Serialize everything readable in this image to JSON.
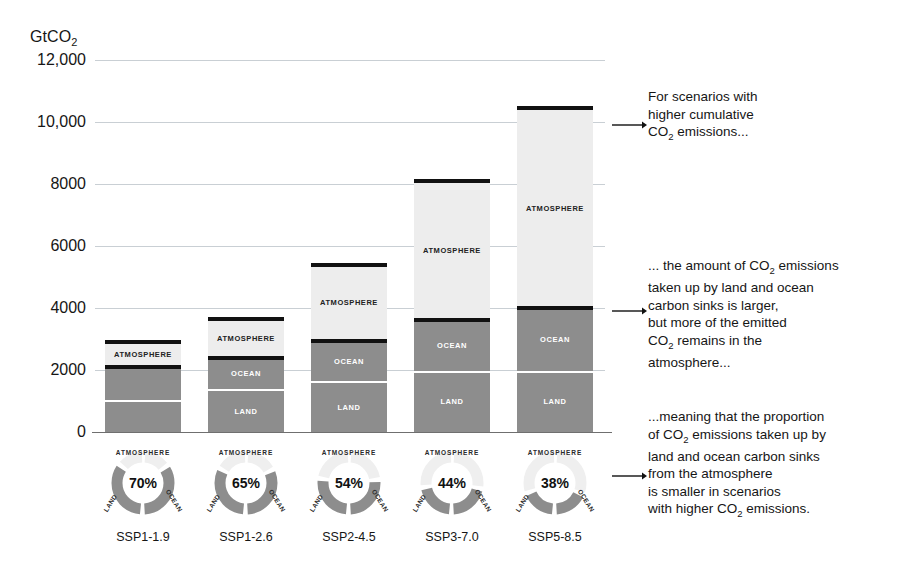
{
  "axis": {
    "unit_label": "GtCO",
    "unit_sub": "2",
    "ticks": [
      "12,000",
      "10,000",
      "8000",
      "6000",
      "4000",
      "2000",
      "0"
    ],
    "tick_values": [
      12000,
      10000,
      8000,
      6000,
      4000,
      2000,
      0
    ]
  },
  "segment_labels": {
    "atmosphere": "ATMOSPHERE",
    "ocean": "OCEAN",
    "land": "LAND"
  },
  "colors": {
    "atmosphere": "#ededed",
    "ocean": "#8d8d8d",
    "land": "#8d8d8d",
    "cap": "#111111",
    "gridline": "#c9cfd4",
    "baseline": "#6f6f6f",
    "donut_sink": "#8d8d8d",
    "donut_atmosphere": "#efefef"
  },
  "bars": [
    {
      "name": "SSP1-1.9",
      "total": 2900,
      "land": 1000,
      "ocean": 1100,
      "atmosphere": 800,
      "sink_percent": "70%",
      "sink_percent_value": 70,
      "show_ocean_label": false,
      "show_land_label": false
    },
    {
      "name": "SSP1-2.6",
      "total": 3650,
      "land": 1350,
      "ocean": 1050,
      "atmosphere": 1250,
      "sink_percent": "65%",
      "sink_percent_value": 65,
      "show_ocean_label": true,
      "show_land_label": true
    },
    {
      "name": "SSP2-4.5",
      "total": 5400,
      "land": 1600,
      "ocean": 1350,
      "atmosphere": 2450,
      "sink_percent": "54%",
      "sink_percent_value": 54,
      "show_ocean_label": true,
      "show_land_label": true
    },
    {
      "name": "SSP3-7.0",
      "total": 8100,
      "land": 1950,
      "ocean": 1650,
      "atmosphere": 4500,
      "sink_percent": "44%",
      "sink_percent_value": 44,
      "show_ocean_label": true,
      "show_land_label": true
    },
    {
      "name": "SSP5-8.5",
      "total": 10450,
      "land": 1950,
      "ocean": 2050,
      "atmosphere": 6450,
      "sink_percent": "38%",
      "sink_percent_value": 38,
      "show_ocean_label": true,
      "show_land_label": true
    }
  ],
  "annotations": [
    {
      "id": "annotation-top",
      "lines": [
        {
          "pre": "For scenarios with",
          "sub": "",
          "post": ""
        },
        {
          "pre": "higher cumulative",
          "sub": "",
          "post": ""
        },
        {
          "pre": "CO",
          "sub": "2",
          "post": " emissions..."
        }
      ]
    },
    {
      "id": "annotation-middle",
      "lines": [
        {
          "pre": "... the amount of CO",
          "sub": "2",
          "post": " emissions"
        },
        {
          "pre": "taken up by land and ocean",
          "sub": "",
          "post": ""
        },
        {
          "pre": "carbon sinks is larger,",
          "sub": "",
          "post": ""
        },
        {
          "pre": "but more of the emitted",
          "sub": "",
          "post": ""
        },
        {
          "pre": "CO",
          "sub": "2",
          "post": " remains in the"
        },
        {
          "pre": "atmosphere...",
          "sub": "",
          "post": ""
        }
      ]
    },
    {
      "id": "annotation-bottom",
      "lines": [
        {
          "pre": "...meaning that the proportion",
          "sub": "",
          "post": ""
        },
        {
          "pre": "of CO",
          "sub": "2",
          "post": " emissions taken up by"
        },
        {
          "pre": "land and ocean carbon sinks",
          "sub": "",
          "post": ""
        },
        {
          "pre": "from the atmosphere",
          "sub": "",
          "post": ""
        },
        {
          "pre": "is smaller in scenarios",
          "sub": "",
          "post": ""
        },
        {
          "pre": "with higher CO",
          "sub": "2",
          "post": " emissions."
        }
      ]
    }
  ],
  "chart_data": {
    "type": "bar",
    "title": "",
    "subtitle": "",
    "xlabel": "",
    "ylabel": "GtCO2",
    "ylim": [
      0,
      12000
    ],
    "ytick_values": [
      0,
      2000,
      4000,
      6000,
      8000,
      10000,
      12000
    ],
    "ytick_labels": [
      "0",
      "2000",
      "4000",
      "6000",
      "8000",
      "10,000",
      "12,000"
    ],
    "grid": true,
    "legend": "none",
    "stacked": true,
    "categories": [
      "SSP1-1.9",
      "SSP1-2.6",
      "SSP2-4.5",
      "SSP3-7.0",
      "SSP5-8.5"
    ],
    "series": [
      {
        "name": "LAND",
        "values": [
          1000,
          1350,
          1600,
          1950,
          1950
        ]
      },
      {
        "name": "OCEAN",
        "values": [
          1100,
          1050,
          1350,
          1650,
          2050
        ]
      },
      {
        "name": "ATMOSPHERE",
        "values": [
          800,
          1250,
          2450,
          4500,
          6450
        ]
      }
    ],
    "totals": [
      2900,
      3650,
      5400,
      8100,
      10450
    ],
    "donut_sink_percent": [
      70,
      65,
      54,
      44,
      38
    ],
    "donut_labels": [
      "ATMOSPHERE",
      "LAND",
      "OCEAN"
    ],
    "annotations": [
      "For scenarios with higher cumulative CO2 emissions...",
      "... the amount of CO2 emissions taken up by land and ocean carbon sinks is larger, but more of the emitted CO2 remains in the atmosphere...",
      "...meaning that the proportion of CO2 emissions taken up by land and ocean carbon sinks from the atmosphere is smaller in scenarios with higher CO2 emissions."
    ]
  }
}
